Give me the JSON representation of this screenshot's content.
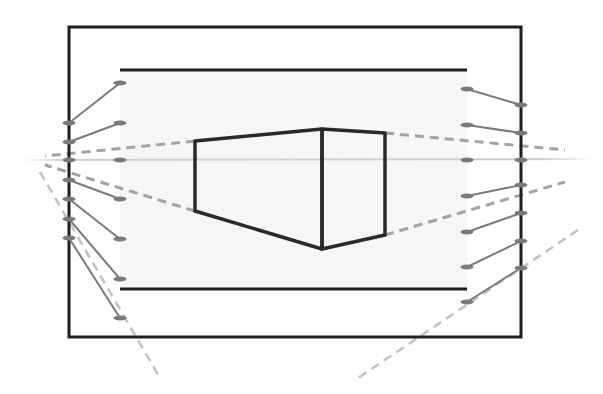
{
  "diagram": {
    "type": "two-point-perspective-construction",
    "colors": {
      "frame": "#1e1e1e",
      "box_outline": "#2a2a2a",
      "tick": "#777777",
      "connector": "#7a7a7a",
      "dashed_guide": "#a0a0a0",
      "horizon": "#cfcfcf",
      "picture_plane_fill": "#f6f6f6"
    },
    "elements": {
      "outer_frame": "Outer picture frame",
      "inner_frame": "Inner picture plane",
      "horizon_line": "Horizon line (eye level)",
      "box": "Box in two-point perspective",
      "left_scale": "Left measuring scale with 7 divisions",
      "right_scale": "Right measuring scale with 7 divisions",
      "guides": "Dashed vanishing-point guides"
    },
    "scales": {
      "left_outer_divisions": 7,
      "left_inner_divisions": 7,
      "right_inner_divisions": 7,
      "right_outer_divisions": 7
    }
  }
}
